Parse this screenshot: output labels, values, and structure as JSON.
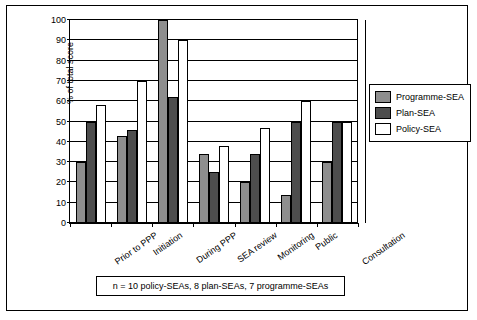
{
  "chart_data": {
    "type": "bar",
    "title": "",
    "xlabel": "",
    "ylabel": "% of total score",
    "ylim": [
      0,
      100
    ],
    "yticks": [
      0,
      10,
      20,
      30,
      40,
      50,
      60,
      70,
      80,
      90,
      100
    ],
    "grid": true,
    "legend_position": "right",
    "categories": [
      "Prior to PPP",
      "Initiation",
      "During PPP",
      "SEA review",
      "Monitoring",
      "Public",
      "Consultation"
    ],
    "series": [
      {
        "name": "Programme-SEA",
        "color": "#8e8e8e",
        "values": [
          30,
          43,
          100,
          34,
          20,
          14,
          30
        ]
      },
      {
        "name": "Plan-SEA",
        "color": "#4d4d4d",
        "values": [
          50,
          46,
          62,
          25,
          34,
          50,
          50
        ]
      },
      {
        "name": "Policy-SEA",
        "color": "#ffffff",
        "values": [
          58,
          70,
          90,
          38,
          47,
          60,
          50
        ]
      }
    ],
    "footnote": "n = 10 policy-SEAs, 8 plan-SEAs, 7 programme-SEAs"
  },
  "legend": {
    "items": [
      {
        "label": "Programme-SEA"
      },
      {
        "label": "Plan-SEA"
      },
      {
        "label": "Policy-SEA"
      }
    ]
  }
}
